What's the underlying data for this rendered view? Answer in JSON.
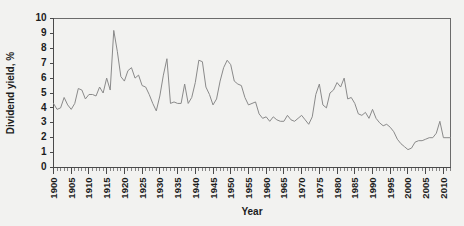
{
  "chart_data": {
    "type": "line",
    "title": "",
    "xlabel": "Year",
    "ylabel": "Dividend yield, %",
    "xlim": [
      1900,
      2012
    ],
    "ylim": [
      0,
      10
    ],
    "grid": false,
    "legend": null,
    "y_ticks": [
      0,
      1,
      2,
      3,
      4,
      5,
      6,
      7,
      8,
      9,
      10
    ],
    "x_ticks": [
      1900,
      1905,
      1910,
      1915,
      1920,
      1925,
      1930,
      1935,
      1940,
      1945,
      1950,
      1955,
      1960,
      1965,
      1970,
      1975,
      1980,
      1985,
      1990,
      1995,
      2000,
      2005,
      2010
    ],
    "x_minor_tick_step": 1,
    "line_color": "#8a8a8a",
    "series": [
      {
        "name": "Dividend yield",
        "x": [
          1900,
          1901,
          1902,
          1903,
          1904,
          1905,
          1906,
          1907,
          1908,
          1909,
          1910,
          1911,
          1912,
          1913,
          1914,
          1915,
          1916,
          1917,
          1918,
          1919,
          1920,
          1921,
          1922,
          1923,
          1924,
          1925,
          1926,
          1927,
          1928,
          1929,
          1930,
          1931,
          1932,
          1933,
          1934,
          1935,
          1936,
          1937,
          1938,
          1939,
          1940,
          1941,
          1942,
          1943,
          1944,
          1945,
          1946,
          1947,
          1948,
          1949,
          1950,
          1951,
          1952,
          1953,
          1954,
          1955,
          1956,
          1957,
          1958,
          1959,
          1960,
          1961,
          1962,
          1963,
          1964,
          1965,
          1966,
          1967,
          1968,
          1969,
          1970,
          1971,
          1972,
          1973,
          1974,
          1975,
          1976,
          1977,
          1978,
          1979,
          1980,
          1981,
          1982,
          1983,
          1984,
          1985,
          1986,
          1987,
          1988,
          1989,
          1990,
          1991,
          1992,
          1993,
          1994,
          1995,
          1996,
          1997,
          1998,
          1999,
          2000,
          2001,
          2002,
          2003,
          2004,
          2005,
          2006,
          2007,
          2008,
          2009,
          2010,
          2011,
          2012
        ],
        "values": [
          4.3,
          3.9,
          4.0,
          4.7,
          4.2,
          3.9,
          4.3,
          5.3,
          5.2,
          4.6,
          4.9,
          4.9,
          4.8,
          5.4,
          5.0,
          6.0,
          5.2,
          9.2,
          7.8,
          6.1,
          5.8,
          6.5,
          6.7,
          6.0,
          6.2,
          5.5,
          5.4,
          4.9,
          4.3,
          3.8,
          4.8,
          6.2,
          7.3,
          4.3,
          4.4,
          4.3,
          4.3,
          5.6,
          4.3,
          4.7,
          5.7,
          7.2,
          7.1,
          5.4,
          4.9,
          4.2,
          4.6,
          5.8,
          6.7,
          7.2,
          6.9,
          5.8,
          5.6,
          5.5,
          4.7,
          4.2,
          4.3,
          4.4,
          3.6,
          3.3,
          3.4,
          3.1,
          3.4,
          3.2,
          3.1,
          3.1,
          3.5,
          3.2,
          3.1,
          3.3,
          3.5,
          3.2,
          2.9,
          3.4,
          4.9,
          5.6,
          4.2,
          4.0,
          5.0,
          5.2,
          5.7,
          5.4,
          6.0,
          4.6,
          4.7,
          4.3,
          3.6,
          3.5,
          3.7,
          3.3,
          3.9,
          3.3,
          3.0,
          2.8,
          2.9,
          2.7,
          2.4,
          1.9,
          1.6,
          1.4,
          1.2,
          1.3,
          1.7,
          1.8,
          1.8,
          1.9,
          2.0,
          2.0,
          2.3,
          3.1,
          2.0,
          2.0,
          2.0
        ]
      }
    ]
  }
}
